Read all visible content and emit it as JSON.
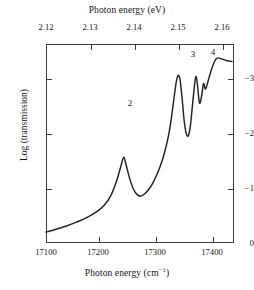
{
  "figure": {
    "top_axis": {
      "title": "Photon energy (eV)",
      "ticks": [
        {
          "label": "2.12",
          "value": 2.12
        },
        {
          "label": "2.13",
          "value": 2.13
        },
        {
          "label": "2.14",
          "value": 2.14
        },
        {
          "label": "2.15",
          "value": 2.15
        },
        {
          "label": "2.16",
          "value": 2.16
        }
      ]
    },
    "bottom_axis": {
      "title_prefix": "Photon energy (cm",
      "title_sup": "−1",
      "title_suffix": ")",
      "ticks": [
        {
          "label": "17100",
          "value": 17100
        },
        {
          "label": "17200",
          "value": 17200
        },
        {
          "label": "17300",
          "value": 17300
        },
        {
          "label": "17400",
          "value": 17400
        }
      ]
    },
    "y_axis": {
      "title": "Log (transmission)",
      "ticks": [
        {
          "label": "−3",
          "value": -3
        },
        {
          "label": "−2",
          "value": -2
        },
        {
          "label": "−1",
          "value": -1
        },
        {
          "label": "0",
          "value": 0
        }
      ]
    },
    "annotations": [
      {
        "label": "2",
        "x_cm": 17253,
        "y": -1.56
      },
      {
        "label": "3",
        "x_cm": 17361,
        "y": -3.05
      },
      {
        "label": "4",
        "x_cm": 17395,
        "y": -3.03
      }
    ],
    "line_color": "#222222"
  },
  "chart_data": {
    "type": "line",
    "title": "",
    "xlabel": "Photon energy (cm−1)",
    "ylabel": "Log (transmission)",
    "x2label": "Photon energy (eV)",
    "xlim": [
      17100,
      17470
    ],
    "x2lim": [
      2.1202,
      2.1661
    ],
    "ylim": [
      0,
      -3.62
    ],
    "grid": false,
    "legend": null,
    "series": [
      {
        "name": "transmission spectrum",
        "x": [
          17100,
          17120,
          17140,
          17160,
          17180,
          17200,
          17215,
          17228,
          17240,
          17248,
          17253,
          17258,
          17266,
          17275,
          17285,
          17295,
          17305,
          17312,
          17318,
          17325,
          17332,
          17338,
          17344,
          17350,
          17355,
          17358,
          17361,
          17364,
          17368,
          17372,
          17376,
          17380,
          17384,
          17388,
          17392,
          17395,
          17398,
          17402,
          17406,
          17410,
          17414,
          17420,
          17428,
          17436,
          17445,
          17455,
          17466
        ],
        "y": [
          -0.2,
          -0.25,
          -0.31,
          -0.38,
          -0.46,
          -0.57,
          -0.69,
          -0.87,
          -1.16,
          -1.42,
          -1.56,
          -1.41,
          -1.13,
          -0.93,
          -0.85,
          -0.9,
          -1.01,
          -1.12,
          -1.24,
          -1.4,
          -1.6,
          -1.82,
          -2.1,
          -2.5,
          -2.85,
          -3.0,
          -3.05,
          -2.96,
          -2.62,
          -2.22,
          -1.99,
          -1.95,
          -2.12,
          -2.48,
          -2.85,
          -3.03,
          -2.88,
          -2.55,
          -2.66,
          -2.9,
          -2.8,
          -2.98,
          -3.22,
          -3.36,
          -3.35,
          -3.32,
          -3.3
        ]
      }
    ],
    "peaks": [
      {
        "label": "2",
        "x_cm": 17253,
        "x_ev": 2.1391,
        "y": -1.56
      },
      {
        "label": "3",
        "x_cm": 17361,
        "x_ev": 2.1525,
        "y": -3.05
      },
      {
        "label": "4",
        "x_cm": 17395,
        "x_ev": 2.1567,
        "y": -3.03
      }
    ]
  }
}
